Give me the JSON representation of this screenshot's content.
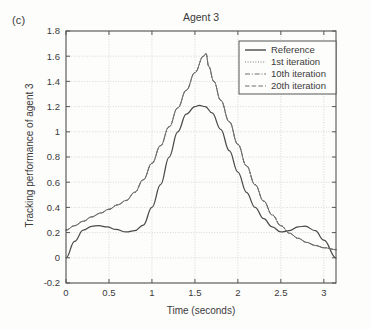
{
  "panel_label": "(c)",
  "axis": {
    "xticks": [
      "0",
      "0.5",
      "1",
      "1.5",
      "2",
      "2.5",
      "3"
    ],
    "yticks": [
      "-0.2",
      "0",
      "0.2",
      "0.4",
      "0.6",
      "0.8",
      "1",
      "1.2",
      "1.4",
      "1.6",
      "1.8"
    ]
  },
  "colors": {
    "reference": "#4a4a4a",
    "iteration": "#6e6e6e",
    "axis": "#555555",
    "grid": "#cfcfcf",
    "background": "#fdfdfc"
  },
  "chart_data": {
    "type": "line",
    "title": "Agent 3",
    "xlabel": "Time (seconds)",
    "ylabel": "Tracking performance of agent 3",
    "xlim": [
      0,
      3.1416
    ],
    "ylim": [
      -0.2,
      1.8
    ],
    "xticks": [
      0,
      0.5,
      1,
      1.5,
      2,
      2.5,
      3
    ],
    "yticks": [
      -0.2,
      0,
      0.2,
      0.4,
      0.6,
      0.8,
      1.0,
      1.2,
      1.4,
      1.6,
      1.8
    ],
    "grid": true,
    "legend_position": "top-right",
    "series": [
      {
        "name": "Reference",
        "style": "solid",
        "x": [
          0.0,
          0.1,
          0.2,
          0.3,
          0.38,
          0.48,
          0.58,
          0.7,
          0.8,
          0.9,
          1.0,
          1.1,
          1.2,
          1.3,
          1.4,
          1.5,
          1.55,
          1.62,
          1.7,
          1.8,
          1.9,
          2.0,
          2.1,
          2.2,
          2.3,
          2.4,
          2.5,
          2.6,
          2.7,
          2.78,
          2.9,
          3.0,
          3.1416
        ],
        "y": [
          0.0,
          0.13,
          0.22,
          0.25,
          0.255,
          0.245,
          0.225,
          0.205,
          0.215,
          0.26,
          0.4,
          0.58,
          0.8,
          1.0,
          1.14,
          1.2,
          1.21,
          1.2,
          1.15,
          1.02,
          0.85,
          0.68,
          0.52,
          0.4,
          0.31,
          0.245,
          0.205,
          0.215,
          0.245,
          0.252,
          0.215,
          0.14,
          0.0
        ]
      },
      {
        "name": "1st iteration",
        "style": "dotted",
        "x": [
          0.0,
          0.1,
          0.2,
          0.3,
          0.4,
          0.5,
          0.6,
          0.7,
          0.8,
          0.9,
          1.0,
          1.1,
          1.2,
          1.3,
          1.4,
          1.5,
          1.6,
          1.63,
          1.66,
          1.72,
          1.8,
          1.9,
          2.0,
          2.1,
          2.2,
          2.3,
          2.4,
          2.5,
          2.6,
          2.7,
          2.8,
          2.9,
          3.0,
          3.1416
        ],
        "y": [
          0.22,
          0.255,
          0.29,
          0.325,
          0.355,
          0.385,
          0.42,
          0.455,
          0.52,
          0.62,
          0.75,
          0.89,
          1.04,
          1.19,
          1.33,
          1.47,
          1.6,
          1.62,
          1.52,
          1.4,
          1.25,
          1.08,
          0.9,
          0.73,
          0.58,
          0.45,
          0.34,
          0.255,
          0.195,
          0.155,
          0.122,
          0.098,
          0.08,
          0.065
        ]
      },
      {
        "name": "10th iteration",
        "style": "dashdot",
        "x": [
          0.0,
          0.1,
          0.2,
          0.3,
          0.4,
          0.5,
          0.6,
          0.7,
          0.8,
          0.9,
          1.0,
          1.1,
          1.2,
          1.3,
          1.4,
          1.5,
          1.6,
          1.63,
          1.66,
          1.72,
          1.8,
          1.9,
          2.0,
          2.1,
          2.2,
          2.3,
          2.4,
          2.5,
          2.6,
          2.7,
          2.8,
          2.9,
          3.0,
          3.1416
        ],
        "y": [
          0.22,
          0.256,
          0.291,
          0.326,
          0.356,
          0.386,
          0.421,
          0.456,
          0.521,
          0.621,
          0.751,
          0.891,
          1.041,
          1.191,
          1.331,
          1.471,
          1.601,
          1.621,
          1.521,
          1.401,
          1.251,
          1.081,
          0.901,
          0.731,
          0.581,
          0.451,
          0.341,
          0.256,
          0.196,
          0.156,
          0.123,
          0.099,
          0.081,
          0.066
        ]
      },
      {
        "name": "20th iteration",
        "style": "dashed",
        "x": [
          0.0,
          0.1,
          0.2,
          0.3,
          0.4,
          0.5,
          0.6,
          0.7,
          0.8,
          0.9,
          1.0,
          1.1,
          1.2,
          1.3,
          1.4,
          1.5,
          1.6,
          1.63,
          1.66,
          1.72,
          1.8,
          1.9,
          2.0,
          2.1,
          2.2,
          2.3,
          2.4,
          2.5,
          2.6,
          2.7,
          2.8,
          2.9,
          3.0,
          3.1416
        ],
        "y": [
          0.22,
          0.254,
          0.289,
          0.324,
          0.354,
          0.384,
          0.419,
          0.454,
          0.519,
          0.619,
          0.749,
          0.889,
          1.039,
          1.189,
          1.329,
          1.469,
          1.599,
          1.619,
          1.519,
          1.399,
          1.249,
          1.079,
          0.899,
          0.729,
          0.579,
          0.449,
          0.339,
          0.254,
          0.194,
          0.154,
          0.121,
          0.097,
          0.079,
          0.064
        ]
      }
    ]
  }
}
